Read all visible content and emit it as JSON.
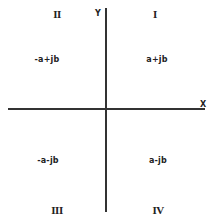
{
  "diagram": {
    "axes": {
      "x_label": "X",
      "y_label": "Y"
    },
    "quadrants": [
      {
        "numeral": "I",
        "expression": "a+jb"
      },
      {
        "numeral": "II",
        "expression": "-a+jb"
      },
      {
        "numeral": "III",
        "expression": "-a-jb"
      },
      {
        "numeral": "IV",
        "expression": "a-jb"
      }
    ],
    "colors": {
      "line": "#333333",
      "text": "#222222",
      "background": "#ffffff"
    }
  }
}
